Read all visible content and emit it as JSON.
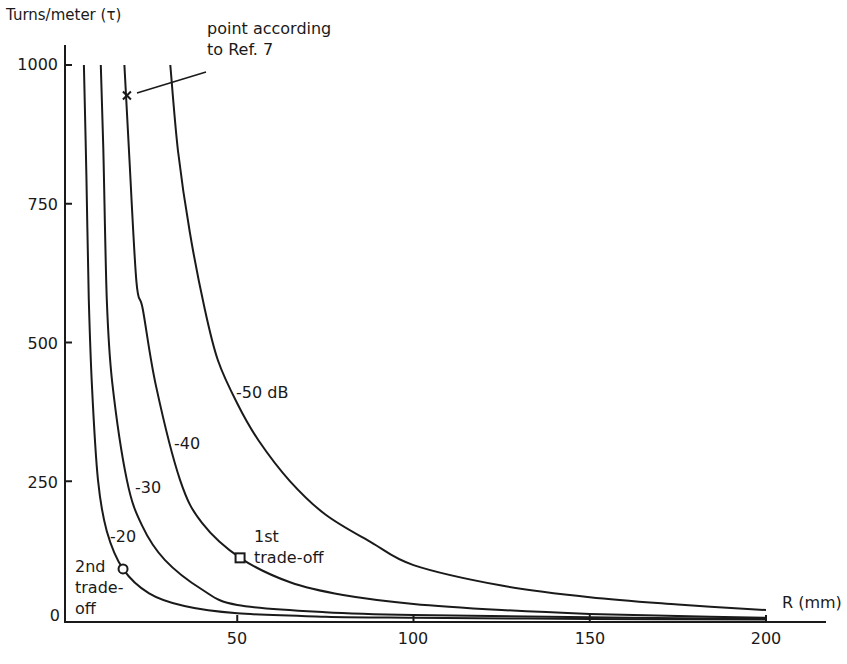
{
  "chart_data": {
    "type": "line",
    "title": "",
    "ylabel": "Turns/meter (τ)",
    "xlabel": "R (mm)",
    "xlim": [
      0,
      220
    ],
    "ylim": [
      0,
      1000
    ],
    "xticks": [
      50,
      100,
      150,
      200
    ],
    "yticks": [
      0,
      250,
      500,
      750,
      1000
    ],
    "grid": false,
    "legend": "inline curve labels",
    "series": [
      {
        "name": "-20",
        "label": "-20",
        "points": [
          [
            6.5,
            1000
          ],
          [
            7.2,
            800
          ],
          [
            7.9,
            577
          ],
          [
            8.8,
            420
          ],
          [
            10.5,
            252
          ],
          [
            13,
            160
          ],
          [
            17.6,
            92
          ],
          [
            25,
            48
          ],
          [
            35,
            25
          ],
          [
            50,
            12
          ],
          [
            75,
            6
          ],
          [
            100,
            4
          ],
          [
            150,
            2
          ],
          [
            200,
            1
          ]
        ]
      },
      {
        "name": "-30",
        "label": "-30",
        "points": [
          [
            11.3,
            1000
          ],
          [
            12,
            850
          ],
          [
            13,
            577
          ],
          [
            14.5,
            430
          ],
          [
            18.7,
            252
          ],
          [
            23,
            170
          ],
          [
            29.5,
            108
          ],
          [
            40,
            55
          ],
          [
            50,
            27
          ],
          [
            75,
            14
          ],
          [
            100,
            9
          ],
          [
            150,
            5
          ],
          [
            200,
            2
          ]
        ]
      },
      {
        "name": "-40",
        "label": "-40",
        "points": [
          [
            18,
            1000
          ],
          [
            19.3,
            845
          ],
          [
            21.4,
            610
          ],
          [
            23.2,
            560
          ],
          [
            27,
            420
          ],
          [
            33.8,
            252
          ],
          [
            40,
            175
          ],
          [
            50.8,
            112
          ],
          [
            65,
            68
          ],
          [
            80,
            45
          ],
          [
            100,
            29
          ],
          [
            125,
            18
          ],
          [
            150,
            11
          ],
          [
            175,
            7
          ],
          [
            200,
            4
          ]
        ]
      },
      {
        "name": "-50 dB",
        "label": "-50 dB",
        "points": [
          [
            31,
            1000
          ],
          [
            33.2,
            845
          ],
          [
            36.5,
            700
          ],
          [
            40.8,
            560
          ],
          [
            44.5,
            468
          ],
          [
            50,
            390
          ],
          [
            56,
            324
          ],
          [
            65,
            250
          ],
          [
            75,
            190
          ],
          [
            88,
            140
          ],
          [
            100,
            99
          ],
          [
            125,
            62
          ],
          [
            150,
            41
          ],
          [
            175,
            28
          ],
          [
            200,
            18
          ]
        ]
      }
    ],
    "annotations": [
      {
        "text": "point according\nto Ref. 7",
        "marker": "star",
        "series": "-40",
        "x": 18.7,
        "y": 945
      },
      {
        "text": "1st\ntrade-off",
        "marker": "square",
        "series": "-40",
        "x": 50.8,
        "y": 112
      },
      {
        "text": "2nd\ntrade-\noff",
        "marker": "circle",
        "series": "-20",
        "x": 17.6,
        "y": 92
      }
    ]
  },
  "labels": {
    "y_axis_title": "Turns/meter (τ)",
    "x_axis_title": "R (mm)",
    "curve_m20": "-20",
    "curve_m30": "-30",
    "curve_m40": "-40",
    "curve_m50": "-50 dB",
    "ref7_line1": "point according",
    "ref7_line2": "to Ref. 7",
    "first_line1": "1st",
    "first_line2": "trade-off",
    "second_line1": "2nd",
    "second_line2": "trade-",
    "second_line3": "off",
    "ytick_1000": "1000",
    "ytick_750": "750",
    "ytick_500": "500",
    "ytick_250": "250",
    "ytick_0": "0",
    "xtick_50": "50",
    "xtick_100": "100",
    "xtick_150": "150",
    "xtick_200": "200"
  }
}
